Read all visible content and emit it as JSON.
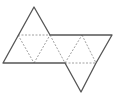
{
  "diagram": {
    "type": "net-of-polyhedron",
    "colors": {
      "outline": "#555555",
      "fold": "#888888",
      "background": "#ffffff"
    },
    "outline": [
      [
        34,
        7
      ],
      [
        50,
        35
      ],
      [
        112,
        35
      ],
      [
        96,
        63
      ],
      [
        81,
        92
      ],
      [
        65,
        63
      ],
      [
        3,
        63
      ]
    ],
    "folds": [
      [
        [
          18,
          35
        ],
        [
          50,
          35
        ]
      ],
      [
        [
          18,
          35
        ],
        [
          34,
          63
        ]
      ],
      [
        [
          34,
          63
        ],
        [
          50,
          35
        ]
      ],
      [
        [
          50,
          35
        ],
        [
          65,
          63
        ]
      ],
      [
        [
          65,
          63
        ],
        [
          82,
          35
        ]
      ],
      [
        [
          82,
          35
        ],
        [
          96,
          63
        ]
      ],
      [
        [
          65,
          63
        ],
        [
          96,
          63
        ]
      ]
    ]
  }
}
